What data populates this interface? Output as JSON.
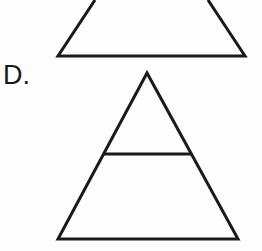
{
  "page": {
    "width": 262,
    "height": 251,
    "background_color": "#fdfdfd",
    "stroke_color": "#1a1a1a",
    "stroke_width": 3
  },
  "choice": {
    "label": "D."
  },
  "figures": [
    {
      "name": "partial-trapezoid-top",
      "description": "Triangle clipped by the top edge of the image, appearing as a trapezoid",
      "shape": "open-polyline",
      "points": "95,0 58,56 245,56 208,0"
    },
    {
      "name": "triangle-with-horizontal-divider",
      "description": "Isosceles triangle with one horizontal line across the interior",
      "shape": "triangle",
      "points": "147,73 58,239 238,239",
      "divider": {
        "name": "horizontal-divider-line",
        "x1": 103,
        "y1": 154,
        "x2": 192,
        "y2": 154
      }
    }
  ]
}
